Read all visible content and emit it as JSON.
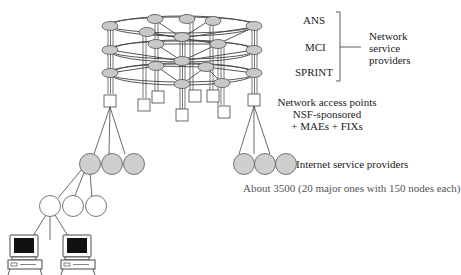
{
  "diagram": {
    "type": "network-hierarchy",
    "backbone": {
      "providers": [
        "ANS",
        "MCI",
        "SPRINT"
      ],
      "group_label_lines": [
        "Network",
        "service",
        "providers"
      ],
      "ring_count": 3,
      "node_fill": "#c8c8c8"
    },
    "access_points": {
      "label": "Network access points",
      "sub_lines": [
        "NSF-sponsored",
        "+ MAEs + FIXs"
      ],
      "count": 10
    },
    "isps": {
      "label": "Internet service providers",
      "note": "About 3500 (20 major ones with 150 nodes each)",
      "node_fill": "#cfcfcf"
    },
    "local": {
      "node_fill": "#ffffff",
      "computers": 2
    }
  }
}
